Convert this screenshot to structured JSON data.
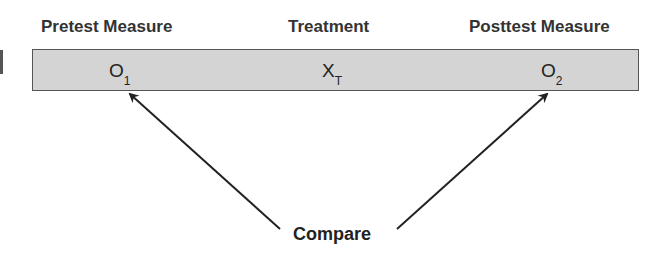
{
  "diagram": {
    "headers": [
      "Pretest Measure",
      "Treatment",
      "Posttest Measure"
    ],
    "symbols": [
      {
        "base": "O",
        "sub": "1"
      },
      {
        "base": "X",
        "sub": "T"
      },
      {
        "base": "O",
        "sub": "2"
      }
    ],
    "compare_label": "Compare",
    "colors": {
      "bar_fill": "#d4d4d4",
      "bar_border": "#555555",
      "arrow": "#222222"
    }
  }
}
